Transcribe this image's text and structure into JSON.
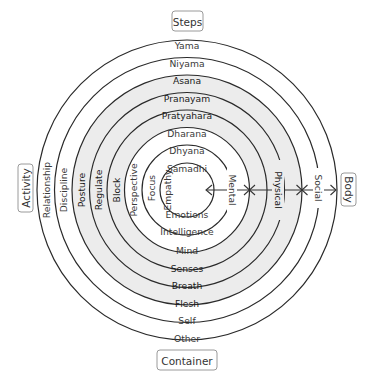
{
  "diagram": {
    "center": {
      "x": 187,
      "y": 190
    },
    "radii": [
      150,
      132.5,
      115,
      97.5,
      80,
      62.5,
      45,
      27
    ],
    "shade_color": "#ececec",
    "shaded_rings": [
      2,
      3,
      4
    ],
    "axes": {
      "top": "Steps",
      "bottom": "Container",
      "left": "Activity",
      "right": "Body"
    },
    "rings": [
      {
        "top": "Yama",
        "bottom": "Other",
        "left": "Relationship",
        "right": "Social"
      },
      {
        "top": "Niyama",
        "bottom": "Self",
        "left": "Discipline",
        "right": ""
      },
      {
        "top": "Asana",
        "bottom": "Flesh",
        "left": "Posture",
        "right": ""
      },
      {
        "top": "Pranayam",
        "bottom": "Breath",
        "left": "Regulate",
        "right": "Physical"
      },
      {
        "top": "Pratyahara",
        "bottom": "Senses",
        "left": "Block",
        "right": ""
      },
      {
        "top": "Dharana",
        "bottom": "Mind",
        "left": "Perspective",
        "right": ""
      },
      {
        "top": "Dhyana",
        "bottom": "Intelligence",
        "left": "Focus",
        "right": "Mental"
      },
      {
        "top": "Samadhi",
        "bottom": "Emotions",
        "left": "Empathy",
        "right": ""
      }
    ],
    "right_labels": {
      "mental": "Mental",
      "physical": "Physical",
      "social": "Social"
    }
  }
}
